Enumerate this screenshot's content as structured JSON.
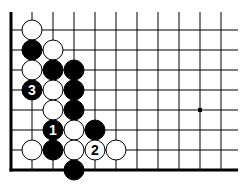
{
  "diagram": {
    "type": "go-board-diagram",
    "board": {
      "columns": 11,
      "rows": 8,
      "origin_x": 11,
      "origin_y": 30,
      "col_spacing": 21,
      "row_spacing": 20,
      "line_top": 12,
      "line_right": 238,
      "left_edge_thick": true,
      "bottom_edge_thick": true,
      "star_points": [
        {
          "col": 9,
          "row": 4
        }
      ]
    },
    "colors": {
      "background": "#ffffff",
      "line": "#000000",
      "black_stone": "#000000",
      "white_stone": "#ffffff",
      "black_label": "#ffffff",
      "white_label": "#000000"
    },
    "stones": [
      {
        "color": "white",
        "col": 1,
        "row": 0,
        "label": ""
      },
      {
        "color": "black",
        "col": 1,
        "row": 1,
        "label": ""
      },
      {
        "color": "white",
        "col": 2,
        "row": 1,
        "label": ""
      },
      {
        "color": "white",
        "col": 1,
        "row": 2,
        "label": ""
      },
      {
        "color": "black",
        "col": 2,
        "row": 2,
        "label": ""
      },
      {
        "color": "black",
        "col": 3,
        "row": 2,
        "label": ""
      },
      {
        "color": "black",
        "col": 1,
        "row": 3,
        "label": "3"
      },
      {
        "color": "white",
        "col": 2,
        "row": 3,
        "label": ""
      },
      {
        "color": "black",
        "col": 3,
        "row": 3,
        "label": ""
      },
      {
        "color": "white",
        "col": 2,
        "row": 4,
        "label": ""
      },
      {
        "color": "black",
        "col": 3,
        "row": 4,
        "label": ""
      },
      {
        "color": "black",
        "col": 2,
        "row": 5,
        "label": "1"
      },
      {
        "color": "white",
        "col": 3,
        "row": 5,
        "label": ""
      },
      {
        "color": "black",
        "col": 4,
        "row": 5,
        "label": ""
      },
      {
        "color": "white",
        "col": 1,
        "row": 6,
        "label": ""
      },
      {
        "color": "black",
        "col": 2,
        "row": 6,
        "label": ""
      },
      {
        "color": "white",
        "col": 3,
        "row": 6,
        "label": ""
      },
      {
        "color": "white",
        "col": 4,
        "row": 6,
        "label": "2"
      },
      {
        "color": "white",
        "col": 5,
        "row": 6,
        "label": ""
      },
      {
        "color": "black",
        "col": 3,
        "row": 7,
        "label": ""
      }
    ]
  }
}
